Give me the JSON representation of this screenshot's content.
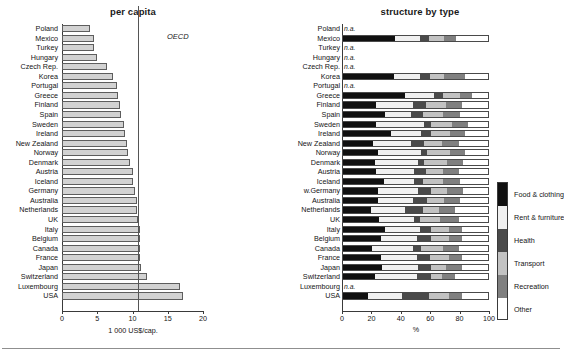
{
  "chart_data": [
    {
      "type": "bar",
      "title": "per capita",
      "xlabel": "1 000 US$/cap.",
      "ylabel": "",
      "orientation": "horizontal",
      "xlim": [
        0,
        20
      ],
      "xticks": [
        0,
        5,
        10,
        15,
        20
      ],
      "grid": false,
      "legend": "none",
      "annotation": {
        "label": "OECD",
        "value": 10.8
      },
      "categories": [
        "Poland",
        "Mexico",
        "Turkey",
        "Hungary",
        "Czech Rep.",
        "Korea",
        "Portugal",
        "Greece",
        "Finland",
        "Spain",
        "Sweden",
        "Ireland",
        "New Zealand",
        "Norway",
        "Denmark",
        "Austria",
        "Iceland",
        "Germany",
        "Australia",
        "Netherlands",
        "UK",
        "Italy",
        "Belgium",
        "Canada",
        "France",
        "Japan",
        "Switzerland",
        "Luxembourg",
        "USA"
      ],
      "values": [
        4.0,
        4.6,
        4.6,
        5.0,
        6.4,
        7.2,
        7.8,
        8.0,
        8.2,
        8.3,
        8.8,
        8.9,
        9.2,
        9.3,
        9.6,
        10.1,
        10.1,
        10.4,
        10.6,
        10.7,
        10.8,
        11.0,
        11.1,
        11.1,
        11.1,
        11.2,
        12.0,
        16.8,
        17.2
      ]
    },
    {
      "type": "bar",
      "subtype": "stacked-percent",
      "title": "structure by type",
      "xlabel": "%",
      "ylabel": "",
      "orientation": "horizontal",
      "xlim": [
        0,
        100
      ],
      "xticks": [
        0,
        20,
        40,
        60,
        80,
        100
      ],
      "grid": false,
      "legend_position": "right",
      "series_names": [
        "Food & clothing",
        "Rent & furniture",
        "Health",
        "Transport",
        "Recreation",
        "Other"
      ],
      "series_colors": [
        "#101010",
        "#f0f0f0",
        "#4a4a4a",
        "#c2c2c2",
        "#808080",
        "#ffffff"
      ],
      "na_label": "n.a.",
      "categories": [
        "Poland",
        "Mexico",
        "Turkey",
        "Hungary",
        "Czech Rep.",
        "Korea",
        "Portugal",
        "Greece",
        "Finland",
        "Spain",
        "Sweden",
        "Ireland",
        "New Zealand",
        "Norway",
        "Denmark",
        "Austria",
        "Iceland",
        "w.Germany",
        "Australia",
        "Netherlands",
        "UK",
        "Italy",
        "Belgium",
        "Canada",
        "France",
        "Japan",
        "Switzerland",
        "Luxembourg",
        "USA"
      ],
      "rows": [
        {
          "country": "Poland",
          "na": true,
          "values": null
        },
        {
          "country": "Mexico",
          "na": false,
          "values": [
            36,
            17,
            6,
            11,
            8,
            22
          ]
        },
        {
          "country": "Turkey",
          "na": true,
          "values": null
        },
        {
          "country": "Hungary",
          "na": true,
          "values": null
        },
        {
          "country": "Czech Rep.",
          "na": true,
          "values": null
        },
        {
          "country": "Korea",
          "na": false,
          "values": [
            35,
            18,
            7,
            10,
            14,
            16
          ]
        },
        {
          "country": "Portugal",
          "na": true,
          "values": null
        },
        {
          "country": "Greece",
          "na": false,
          "values": [
            43,
            20,
            6,
            12,
            8,
            11
          ]
        },
        {
          "country": "Finland",
          "na": false,
          "values": [
            23,
            25,
            9,
            14,
            11,
            18
          ]
        },
        {
          "country": "Spain",
          "na": false,
          "values": [
            29,
            18,
            8,
            14,
            12,
            19
          ]
        },
        {
          "country": "Sweden",
          "na": false,
          "values": [
            23,
            33,
            5,
            14,
            11,
            14
          ]
        },
        {
          "country": "Ireland",
          "na": false,
          "values": [
            33,
            21,
            7,
            13,
            10,
            16
          ]
        },
        {
          "country": "New Zealand",
          "na": false,
          "values": [
            21,
            26,
            9,
            12,
            12,
            20
          ]
        },
        {
          "country": "Norway",
          "na": false,
          "values": [
            24,
            30,
            4,
            16,
            10,
            16
          ]
        },
        {
          "country": "Denmark",
          "na": false,
          "values": [
            22,
            30,
            4,
            16,
            11,
            17
          ]
        },
        {
          "country": "Austria",
          "na": false,
          "values": [
            23,
            26,
            8,
            12,
            11,
            20
          ]
        },
        {
          "country": "Iceland",
          "na": false,
          "values": [
            28,
            21,
            6,
            14,
            12,
            19
          ]
        },
        {
          "country": "w.Germany",
          "na": false,
          "values": [
            24,
            28,
            9,
            11,
            11,
            17
          ]
        },
        {
          "country": "Australia",
          "na": false,
          "values": [
            24,
            24,
            10,
            12,
            11,
            19
          ]
        },
        {
          "country": "Netherlands",
          "na": false,
          "values": [
            19,
            24,
            12,
            11,
            11,
            23
          ]
        },
        {
          "country": "UK",
          "na": false,
          "values": [
            25,
            24,
            4,
            14,
            13,
            20
          ]
        },
        {
          "country": "Italy",
          "na": false,
          "values": [
            29,
            24,
            8,
            12,
            9,
            18
          ]
        },
        {
          "country": "Belgium",
          "na": false,
          "values": [
            26,
            25,
            10,
            12,
            9,
            18
          ]
        },
        {
          "country": "Canada",
          "na": false,
          "values": [
            20,
            28,
            6,
            15,
            11,
            20
          ]
        },
        {
          "country": "France",
          "na": false,
          "values": [
            26,
            25,
            9,
            13,
            9,
            18
          ]
        },
        {
          "country": "Japan",
          "na": false,
          "values": [
            27,
            25,
            9,
            10,
            11,
            18
          ]
        },
        {
          "country": "Switzerland",
          "na": false,
          "values": [
            22,
            29,
            10,
            7,
            9,
            23
          ]
        },
        {
          "country": "Luxembourg",
          "na": true,
          "values": null
        },
        {
          "country": "USA",
          "na": false,
          "values": [
            17,
            24,
            18,
            14,
            9,
            18
          ]
        }
      ]
    }
  ],
  "left": {
    "title": "per capita",
    "axis_title": "1 000 US$/cap.",
    "oecd_label": "OECD"
  },
  "right": {
    "title": "structure by type",
    "axis_title": "%"
  },
  "legend": {
    "items": [
      {
        "label": "Food & clothing",
        "color": "#101010"
      },
      {
        "label": "Rent & furniture",
        "color": "#f0f0f0"
      },
      {
        "label": "Health",
        "color": "#4a4a4a"
      },
      {
        "label": "Transport",
        "color": "#c2c2c2"
      },
      {
        "label": "Recreation",
        "color": "#808080"
      },
      {
        "label": "Other",
        "color": "#ffffff"
      }
    ]
  }
}
